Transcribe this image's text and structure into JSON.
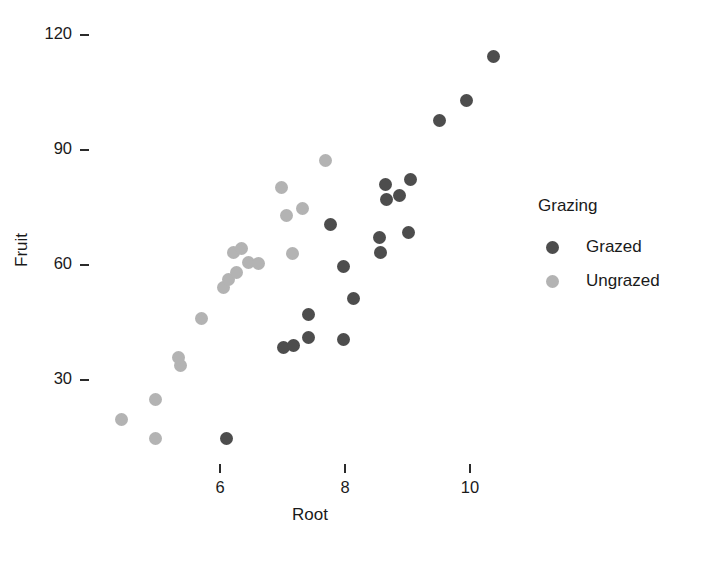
{
  "chart_data": {
    "type": "scatter",
    "title": "",
    "xlabel": "Root",
    "ylabel": "Fruit",
    "xlim": [
      4.3,
      10.9
    ],
    "ylim": [
      12,
      122
    ],
    "xticks": [
      6,
      8,
      10
    ],
    "yticks": [
      30,
      60,
      90,
      120
    ],
    "xtick_labels": [
      "6",
      "8",
      "10"
    ],
    "ytick_labels": [
      "30",
      "60",
      "90",
      "120"
    ],
    "grid": false,
    "legend": {
      "title": "Grazing",
      "position": "right",
      "entries": [
        {
          "label": "Grazed",
          "color": "#4d4d4d"
        },
        {
          "label": "Ungrazed",
          "color": "#b3b3b3"
        }
      ]
    },
    "series": [
      {
        "name": "Grazed",
        "color": "#4d4d4d",
        "points": [
          {
            "x": 6.11,
            "y": 14.8
          },
          {
            "x": 7.02,
            "y": 38.5
          },
          {
            "x": 7.18,
            "y": 39.1
          },
          {
            "x": 7.42,
            "y": 47.0
          },
          {
            "x": 7.42,
            "y": 41.1
          },
          {
            "x": 7.97,
            "y": 40.5
          },
          {
            "x": 8.13,
            "y": 51.2
          },
          {
            "x": 7.98,
            "y": 59.7
          },
          {
            "x": 7.76,
            "y": 70.6
          },
          {
            "x": 8.55,
            "y": 67.3
          },
          {
            "x": 8.57,
            "y": 63.2
          },
          {
            "x": 9.01,
            "y": 68.6
          },
          {
            "x": 8.67,
            "y": 77.0
          },
          {
            "x": 8.87,
            "y": 78.1
          },
          {
            "x": 8.64,
            "y": 81.0
          },
          {
            "x": 9.04,
            "y": 82.3
          },
          {
            "x": 9.51,
            "y": 97.6
          },
          {
            "x": 9.95,
            "y": 103.0
          },
          {
            "x": 10.37,
            "y": 114.3
          }
        ]
      },
      {
        "name": "Ungrazed",
        "color": "#b3b3b3",
        "points": [
          {
            "x": 4.43,
            "y": 19.7
          },
          {
            "x": 4.96,
            "y": 14.7
          },
          {
            "x": 4.97,
            "y": 25.0
          },
          {
            "x": 5.36,
            "y": 33.7
          },
          {
            "x": 5.33,
            "y": 35.8
          },
          {
            "x": 5.71,
            "y": 46.0
          },
          {
            "x": 6.06,
            "y": 54.1
          },
          {
            "x": 6.13,
            "y": 56.3
          },
          {
            "x": 6.26,
            "y": 58.1
          },
          {
            "x": 6.21,
            "y": 63.2
          },
          {
            "x": 6.35,
            "y": 64.2
          },
          {
            "x": 6.45,
            "y": 60.7
          },
          {
            "x": 6.62,
            "y": 60.5
          },
          {
            "x": 7.16,
            "y": 63.0
          },
          {
            "x": 7.06,
            "y": 72.8
          },
          {
            "x": 7.32,
            "y": 74.8
          },
          {
            "x": 6.98,
            "y": 80.3
          },
          {
            "x": 7.68,
            "y": 87.2
          }
        ]
      }
    ]
  },
  "axis": {
    "xlabel": "Root",
    "ylabel": "Fruit"
  }
}
